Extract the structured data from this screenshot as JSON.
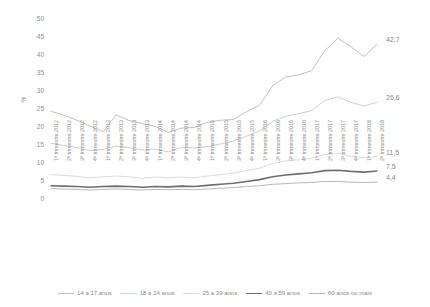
{
  "chart_data": {
    "type": "line",
    "title": "",
    "subtitle": "",
    "xlabel": "",
    "ylabel": "%",
    "ylim": [
      0,
      50
    ],
    "ytick_labels": [
      "50",
      "45",
      "40",
      "35",
      "30",
      "25",
      "20",
      "15",
      "10",
      "5",
      "0"
    ],
    "ytick_values": [
      50,
      45,
      40,
      35,
      30,
      25,
      20,
      15,
      10,
      5,
      0
    ],
    "grid": false,
    "legend_position": "bottom",
    "categories": [
      "1º trimestre 2012",
      "2º trimestre 2012",
      "3º trimestre 2012",
      "4º trimestre 2012",
      "1º trimestre 2013",
      "2º trimestre 2013",
      "3º trimestre 2013",
      "4º trimestre 2013",
      "1º trimestre 2014",
      "2º trimestre 2014",
      "3º trimestre 2014",
      "4º trimestre 2014",
      "1º trimestre 2015",
      "2º trimestre 2015",
      "3º trimestre 2015",
      "4º trimestre 2015",
      "1º trimestre 2016",
      "2º trimestre 2016",
      "3º trimestre 2016",
      "4º trimestre 2016",
      "1º trimestre 2017",
      "2º trimestre 2017",
      "3º trimestre 2017",
      "4º trimestre 2017",
      "1º trimestre 2018",
      "2º trimestre 2018"
    ],
    "series": [
      {
        "name": "14 a 17 anos",
        "color": "#c2c2c2",
        "width": 1.0,
        "end_value_label": "42,7",
        "values": [
          24.1,
          23.0,
          21.6,
          20.0,
          18.4,
          23.1,
          21.5,
          20.7,
          19.9,
          18.2,
          19.4,
          19.6,
          21.0,
          21.6,
          21.8,
          24.0,
          25.8,
          31.2,
          33.6,
          34.2,
          35.4,
          40.9,
          44.4,
          42.0,
          39.3,
          42.7
        ]
      },
      {
        "name": "18 a 24 anos",
        "color": "#d0d0d0",
        "width": 1.0,
        "end_value_label": "26,6",
        "values": [
          15.2,
          14.6,
          14.0,
          13.2,
          13.5,
          14.4,
          14.0,
          13.3,
          13.6,
          12.8,
          14.0,
          13.9,
          14.3,
          15.0,
          15.8,
          17.2,
          18.6,
          21.3,
          22.7,
          23.4,
          24.3,
          27.1,
          28.1,
          26.6,
          25.5,
          26.6
        ]
      },
      {
        "name": "25 a 39 anos",
        "color": "#dcdcdc",
        "width": 1.0,
        "end_value_label": "11,5",
        "values": [
          6.5,
          6.3,
          6.0,
          5.6,
          5.9,
          6.1,
          5.9,
          5.5,
          5.8,
          5.6,
          5.8,
          5.6,
          6.1,
          6.5,
          6.9,
          7.6,
          8.3,
          9.6,
          10.3,
          10.6,
          11.0,
          12.1,
          12.4,
          11.6,
          11.2,
          11.5
        ]
      },
      {
        "name": "40 a 59 anos",
        "color": "#6e6e6e",
        "width": 1.6,
        "end_value_label": "7,5",
        "values": [
          3.4,
          3.3,
          3.2,
          3.0,
          3.2,
          3.3,
          3.2,
          3.0,
          3.2,
          3.1,
          3.3,
          3.2,
          3.5,
          3.8,
          4.1,
          4.6,
          5.1,
          5.9,
          6.4,
          6.7,
          7.0,
          7.6,
          7.7,
          7.4,
          7.2,
          7.5
        ]
      },
      {
        "name": "60 anos ou mais",
        "color": "#b8b8b8",
        "width": 1.0,
        "end_value_label": "4,4",
        "values": [
          2.6,
          2.5,
          2.4,
          2.2,
          2.4,
          2.5,
          2.4,
          2.2,
          2.4,
          2.3,
          2.4,
          2.3,
          2.5,
          2.7,
          2.9,
          3.2,
          3.4,
          3.8,
          4.0,
          4.2,
          4.3,
          4.6,
          4.6,
          4.4,
          4.3,
          4.4
        ]
      }
    ]
  }
}
